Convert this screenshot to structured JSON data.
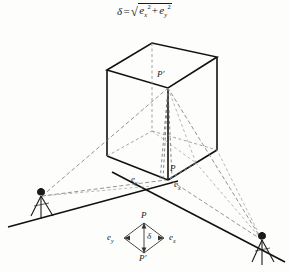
{
  "figure": {
    "title_formula": {
      "lhs": "δ",
      "equals": "=",
      "radical": "√",
      "term1_base": "e",
      "term1_sub": "x",
      "term1_sup": "2",
      "plus": "+",
      "term2_base": "e",
      "term2_sub": "y",
      "term2_sup": "2",
      "plain": "δ = √(e_x² + e_y²)"
    },
    "labels": {
      "p_prime_top": "P'",
      "p_main": "P",
      "e_y_main": "e",
      "e_y_main_sub": "y",
      "e_x_main": "e",
      "e_x_main_sub": "x",
      "inset_p": "P",
      "inset_p_prime": "P'",
      "inset_e_y": "e",
      "inset_e_y_sub": "y",
      "inset_e_x": "e",
      "inset_e_x_sub": "x",
      "inset_delta": "δ"
    },
    "objects": {
      "box_name": "building-block",
      "left_instrument": "theodolite-tripod-left",
      "right_instrument": "theodolite-tripod-right",
      "ground_line_left": "ground-line-left",
      "ground_line_right": "ground-line-right",
      "inset_name": "error-rhombus-inset"
    },
    "colors": {
      "ink": "#1a1a1a",
      "solid_line": "#111111",
      "dashed_line": "#555555",
      "hidden_edge": "#8a8a8a",
      "background": "#fdfdfc"
    }
  }
}
